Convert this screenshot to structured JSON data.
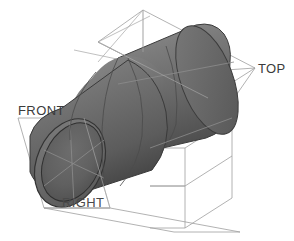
{
  "viewport": {
    "width": 294,
    "height": 241,
    "background_color": "#ffffff"
  },
  "model": {
    "name": "elbow-pipe",
    "description": "Shaded 3D elbow pipe (45 degree bend) with open circular end",
    "shading_color_light": "#8a8a8a",
    "shading_color_mid": "#6e6e6e",
    "shading_color_dark": "#4a4a4a",
    "edge_color": "#3a3a3a",
    "seam_color": "#4e4e4e"
  },
  "datum_planes": {
    "line_color": "#9a9a9a",
    "items": [
      {
        "id": "top",
        "label": "TOP",
        "label_x": 258,
        "label_y": 61
      },
      {
        "id": "front",
        "label": "FRONT",
        "label_x": 18,
        "label_y": 103
      },
      {
        "id": "right",
        "label": "RIGHT",
        "label_x": 62,
        "label_y": 195
      }
    ]
  }
}
